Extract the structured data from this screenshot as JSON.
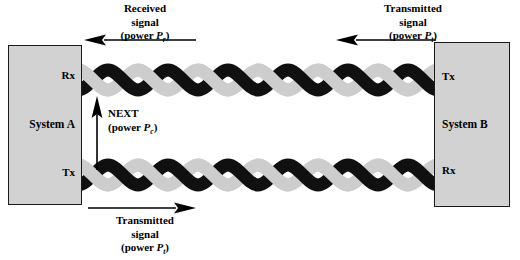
{
  "diagram": {
    "colors": {
      "box_fill": "#d2d2d2",
      "box_border": "#1a1a1a",
      "strand_dark": "#101010",
      "strand_light": "#cdcdcd",
      "arrow": "#000000",
      "background": "#ffffff"
    }
  },
  "system_a": {
    "name": "System A",
    "port_top": "Rx",
    "port_bottom": "Tx"
  },
  "system_b": {
    "name": "System B",
    "port_top": "Tx",
    "port_bottom": "Rx"
  },
  "captions": {
    "received": {
      "line1": "Received",
      "line2": "signal",
      "power_prefix": "(power ",
      "power_symbol": "P",
      "power_subscript": "r",
      "power_suffix": ")"
    },
    "transmitted_top": {
      "line1": "Transmitted",
      "line2": "signal",
      "power_prefix": "(power ",
      "power_symbol": "P",
      "power_subscript": "t",
      "power_suffix": ")"
    },
    "transmitted_bottom": {
      "line1": "Transmitted",
      "line2": "signal",
      "power_prefix": "(power ",
      "power_symbol": "P",
      "power_subscript": "t",
      "power_suffix": ")"
    },
    "next": {
      "line1": "NEXT",
      "power_prefix": "(power ",
      "power_symbol": "P",
      "power_subscript": "c",
      "power_suffix": ")"
    }
  },
  "arrows": {
    "received_signal": {
      "direction": "left"
    },
    "transmitted_signal_top": {
      "direction": "left"
    },
    "next_coupling": {
      "direction": "up"
    },
    "transmitted_signal_bottom": {
      "direction": "right"
    }
  },
  "cables": {
    "top": {
      "label": "twisted-pair-top",
      "twists": 6
    },
    "bottom": {
      "label": "twisted-pair-bottom",
      "twists": 6
    }
  }
}
